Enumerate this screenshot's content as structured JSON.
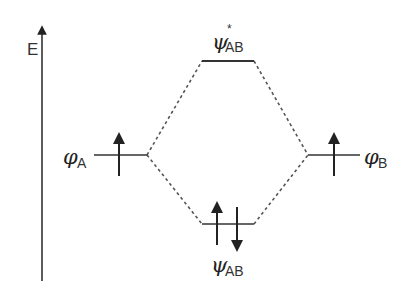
{
  "diagram": {
    "type": "molecular-orbital-energy-diagram",
    "axis": {
      "label": "E",
      "direction": "up"
    },
    "orbitals": {
      "antibonding": {
        "symbol": "ψ",
        "superscript": "*",
        "subscript": "AB",
        "electrons": []
      },
      "atomic_a": {
        "symbol": "φ",
        "subscript": "A",
        "electrons": [
          "up"
        ]
      },
      "atomic_b": {
        "symbol": "φ",
        "subscript": "B",
        "electrons": [
          "up"
        ]
      },
      "bonding": {
        "symbol": "ψ",
        "subscript": "AB",
        "electrons": [
          "up",
          "down"
        ]
      }
    },
    "connections": [
      {
        "from": "atomic_a",
        "to": "antibonding",
        "style": "dashed"
      },
      {
        "from": "atomic_b",
        "to": "antibonding",
        "style": "dashed"
      },
      {
        "from": "atomic_a",
        "to": "bonding",
        "style": "dashed"
      },
      {
        "from": "atomic_b",
        "to": "bonding",
        "style": "dashed"
      }
    ],
    "colors": {
      "line": "#333333",
      "dashed": "#555555",
      "text": "#222222"
    }
  }
}
